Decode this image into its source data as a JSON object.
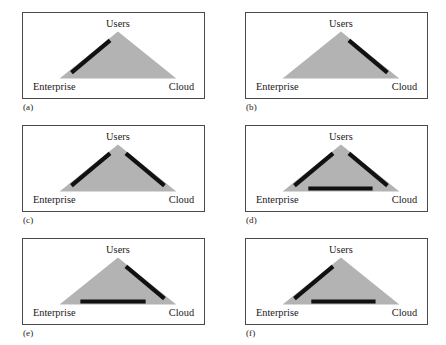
{
  "figure": {
    "title": "",
    "background_color": "#ffffff",
    "panel_border_color": "#4a4a4a",
    "triangle_color": "#b3b3b3",
    "bar_color": "#111111",
    "columns": 2,
    "rows": 3
  },
  "diagram": {
    "type": "triangle-relationship-panels",
    "vertex_labels": {
      "apex": "Users",
      "bottom_left": "Enterprise",
      "bottom_right": "Cloud"
    },
    "panels": [
      {
        "caption": "(a)",
        "name": "panel-a",
        "bars": [
          "left-edge"
        ],
        "description": "Thick black bar along the left (Enterprise-Users) edge"
      },
      {
        "caption": "(b)",
        "name": "panel-b",
        "bars": [
          "right-edge"
        ],
        "description": "Thick black bar along the right (Users-Cloud) edge"
      },
      {
        "caption": "(c)",
        "name": "panel-c",
        "bars": [
          "left-edge",
          "right-edge"
        ],
        "description": "Thick black bars along both the left and right edges"
      },
      {
        "caption": "(d)",
        "name": "panel-d",
        "bars": [
          "left-edge",
          "right-edge",
          "base-edge"
        ],
        "description": "Thick black bars along the left, right and base edges"
      },
      {
        "caption": "(e)",
        "name": "panel-e",
        "bars": [
          "right-edge",
          "base-edge"
        ],
        "description": "Thick black bars along the right and base edges"
      },
      {
        "caption": "(f)",
        "name": "panel-f",
        "bars": [
          "left-edge",
          "base-edge"
        ],
        "description": "Thick black bars along the left and base edges"
      }
    ]
  }
}
